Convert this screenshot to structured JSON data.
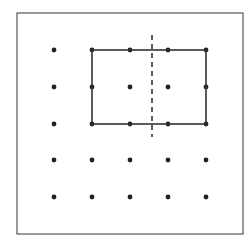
{
  "diagram": {
    "type": "dot-grid-symmetry",
    "frame": {
      "x": 17,
      "y": 13,
      "width": 226,
      "height": 221,
      "stroke": "#555555"
    },
    "grid": {
      "columns_x": [
        54,
        92,
        130,
        168,
        206
      ],
      "rows_y": [
        50,
        87,
        124,
        160,
        197
      ],
      "dot_radius": 2.4,
      "dot_color": "#222222",
      "visible_dots": [
        [
          0,
          0
        ],
        [
          1,
          0
        ],
        [
          2,
          0
        ],
        [
          3,
          0
        ],
        [
          4,
          0
        ],
        [
          0,
          1
        ],
        [
          1,
          1
        ],
        [
          2,
          1
        ],
        [
          3,
          1
        ],
        [
          4,
          1
        ],
        [
          0,
          2
        ],
        [
          1,
          2
        ],
        [
          2,
          2
        ],
        [
          3,
          2
        ],
        [
          4,
          2
        ],
        [
          0,
          3
        ],
        [
          1,
          3
        ],
        [
          2,
          3
        ],
        [
          3,
          3
        ],
        [
          4,
          3
        ],
        [
          0,
          4
        ],
        [
          1,
          4
        ],
        [
          2,
          4
        ],
        [
          3,
          4
        ],
        [
          4,
          4
        ]
      ]
    },
    "rectangle": {
      "x1": 92,
      "y1": 50,
      "x2": 206,
      "y2": 124,
      "stroke": "#333333",
      "stroke_width": 1.6
    },
    "symmetry_line": {
      "x": 152,
      "y1": 35,
      "y2": 137,
      "stroke": "#333333",
      "stroke_width": 1.6,
      "dash": "5,4"
    }
  }
}
